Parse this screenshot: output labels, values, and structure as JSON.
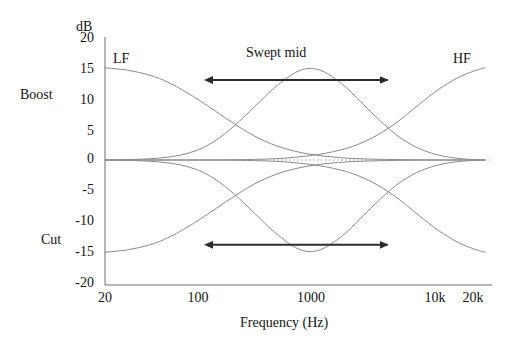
{
  "chart_data": {
    "type": "line",
    "title": "",
    "xlabel": "Frequency (Hz)",
    "ylabel": "dB",
    "xscale": "log",
    "xlim": [
      20,
      20000
    ],
    "ylim": [
      -20,
      20
    ],
    "grid": false,
    "legend": "none",
    "xticks": [
      {
        "value": 20,
        "label": "20"
      },
      {
        "value": 100,
        "label": "100"
      },
      {
        "value": 1000,
        "label": "1000"
      },
      {
        "value": 10000,
        "label": "10k"
      },
      {
        "value": 20000,
        "label": "20k"
      }
    ],
    "yticks": [
      {
        "value": 20,
        "label": "20"
      },
      {
        "value": 15,
        "label": "15"
      },
      {
        "value": 10,
        "label": "10"
      },
      {
        "value": 5,
        "label": "5"
      },
      {
        "value": 0,
        "label": "0"
      },
      {
        "value": -5,
        "label": "-5"
      },
      {
        "value": -10,
        "label": "-10"
      },
      {
        "value": -15,
        "label": "-15"
      },
      {
        "value": -20,
        "label": "-20"
      }
    ],
    "zero_line": {
      "value": 0,
      "style": "dotted"
    },
    "series": [
      {
        "name": "LF shelf boost",
        "band": "LF",
        "mode": "boost",
        "max_gain_db": 15,
        "points": [
          {
            "f": 20,
            "db": 15.0
          },
          {
            "f": 30,
            "db": 14.6
          },
          {
            "f": 45,
            "db": 13.8
          },
          {
            "f": 65,
            "db": 12.5
          },
          {
            "f": 100,
            "db": 10.3
          },
          {
            "f": 150,
            "db": 7.9
          },
          {
            "f": 220,
            "db": 5.6
          },
          {
            "f": 330,
            "db": 3.5
          },
          {
            "f": 500,
            "db": 2.0
          },
          {
            "f": 800,
            "db": 1.0
          },
          {
            "f": 1400,
            "db": 0.4
          },
          {
            "f": 2500,
            "db": 0.15
          },
          {
            "f": 5000,
            "db": 0.05
          },
          {
            "f": 10000,
            "db": 0.0
          },
          {
            "f": 20000,
            "db": 0.0
          }
        ]
      },
      {
        "name": "LF shelf cut",
        "band": "LF",
        "mode": "cut",
        "max_gain_db": -15,
        "points": [
          {
            "f": 20,
            "db": -15.0
          },
          {
            "f": 30,
            "db": -14.6
          },
          {
            "f": 45,
            "db": -13.8
          },
          {
            "f": 65,
            "db": -12.5
          },
          {
            "f": 100,
            "db": -10.3
          },
          {
            "f": 150,
            "db": -7.9
          },
          {
            "f": 220,
            "db": -5.6
          },
          {
            "f": 330,
            "db": -3.5
          },
          {
            "f": 500,
            "db": -2.0
          },
          {
            "f": 800,
            "db": -1.0
          },
          {
            "f": 1400,
            "db": -0.4
          },
          {
            "f": 2500,
            "db": -0.15
          },
          {
            "f": 5000,
            "db": -0.05
          },
          {
            "f": 10000,
            "db": 0.0
          },
          {
            "f": 20000,
            "db": 0.0
          }
        ]
      },
      {
        "name": "Swept mid boost",
        "band": "MID",
        "mode": "boost",
        "max_gain_db": 15,
        "center_hz": 700,
        "points": [
          {
            "f": 20,
            "db": 0.0
          },
          {
            "f": 40,
            "db": 0.15
          },
          {
            "f": 70,
            "db": 0.6
          },
          {
            "f": 110,
            "db": 1.7
          },
          {
            "f": 160,
            "db": 3.6
          },
          {
            "f": 230,
            "db": 6.3
          },
          {
            "f": 330,
            "db": 9.4
          },
          {
            "f": 470,
            "db": 12.3
          },
          {
            "f": 700,
            "db": 14.6
          },
          {
            "f": 1000,
            "db": 14.6
          },
          {
            "f": 1500,
            "db": 12.3
          },
          {
            "f": 2100,
            "db": 9.4
          },
          {
            "f": 3000,
            "db": 6.3
          },
          {
            "f": 4300,
            "db": 3.6
          },
          {
            "f": 6300,
            "db": 1.7
          },
          {
            "f": 9500,
            "db": 0.6
          },
          {
            "f": 14000,
            "db": 0.15
          },
          {
            "f": 20000,
            "db": 0.0
          }
        ]
      },
      {
        "name": "Swept mid cut",
        "band": "MID",
        "mode": "cut",
        "max_gain_db": -15,
        "center_hz": 700,
        "points": [
          {
            "f": 20,
            "db": 0.0
          },
          {
            "f": 40,
            "db": -0.15
          },
          {
            "f": 70,
            "db": -0.6
          },
          {
            "f": 110,
            "db": -1.7
          },
          {
            "f": 160,
            "db": -3.6
          },
          {
            "f": 230,
            "db": -6.3
          },
          {
            "f": 330,
            "db": -9.4
          },
          {
            "f": 470,
            "db": -12.3
          },
          {
            "f": 700,
            "db": -14.6
          },
          {
            "f": 1000,
            "db": -14.6
          },
          {
            "f": 1500,
            "db": -12.3
          },
          {
            "f": 2100,
            "db": -9.4
          },
          {
            "f": 3000,
            "db": -6.3
          },
          {
            "f": 4300,
            "db": -3.6
          },
          {
            "f": 6300,
            "db": -1.7
          },
          {
            "f": 9500,
            "db": -0.6
          },
          {
            "f": 14000,
            "db": -0.15
          },
          {
            "f": 20000,
            "db": 0.0
          }
        ]
      },
      {
        "name": "HF shelf boost",
        "band": "HF",
        "mode": "boost",
        "max_gain_db": 15,
        "points": [
          {
            "f": 20,
            "db": 0.0
          },
          {
            "f": 100,
            "db": 0.0
          },
          {
            "f": 300,
            "db": 0.1
          },
          {
            "f": 600,
            "db": 0.4
          },
          {
            "f": 1100,
            "db": 1.1
          },
          {
            "f": 1800,
            "db": 2.2
          },
          {
            "f": 2800,
            "db": 4.0
          },
          {
            "f": 4200,
            "db": 6.4
          },
          {
            "f": 6000,
            "db": 9.0
          },
          {
            "f": 8500,
            "db": 11.4
          },
          {
            "f": 12000,
            "db": 13.3
          },
          {
            "f": 16000,
            "db": 14.4
          },
          {
            "f": 20000,
            "db": 15.0
          }
        ]
      },
      {
        "name": "HF shelf cut",
        "band": "HF",
        "mode": "cut",
        "max_gain_db": -15,
        "points": [
          {
            "f": 20,
            "db": 0.0
          },
          {
            "f": 100,
            "db": 0.0
          },
          {
            "f": 300,
            "db": -0.1
          },
          {
            "f": 600,
            "db": -0.4
          },
          {
            "f": 1100,
            "db": -1.1
          },
          {
            "f": 1800,
            "db": -2.2
          },
          {
            "f": 2800,
            "db": -4.0
          },
          {
            "f": 4200,
            "db": -6.4
          },
          {
            "f": 6000,
            "db": -9.0
          },
          {
            "f": 8500,
            "db": -11.4
          },
          {
            "f": 12000,
            "db": -13.3
          },
          {
            "f": 16000,
            "db": -14.4
          },
          {
            "f": 20000,
            "db": -15.0
          }
        ]
      }
    ],
    "annotations": [
      {
        "name": "lf-label",
        "text": "LF",
        "f": 32,
        "db": 18.2
      },
      {
        "name": "hf-label",
        "text": "HF",
        "f": 11500,
        "db": 18.2
      },
      {
        "name": "swept-mid-label",
        "text": "Swept mid",
        "f": 800,
        "db": 18.6
      },
      {
        "name": "boost-label",
        "text": "Boost",
        "db": 10.5
      },
      {
        "name": "cut-label",
        "text": "Cut",
        "db": -13.5
      }
    ],
    "arrows": [
      {
        "name": "swept-mid-arrow-boost",
        "from_f": 140,
        "to_f": 3400,
        "db": 13.0,
        "heads": "both"
      },
      {
        "name": "swept-mid-arrow-cut",
        "from_f": 140,
        "to_f": 3400,
        "db": -13.8,
        "heads": "both"
      }
    ]
  },
  "labels": {
    "y_axis_unit": "dB",
    "x_axis_title": "Frequency (Hz)",
    "boost": "Boost",
    "cut": "Cut",
    "lf": "LF",
    "hf": "HF",
    "swept_mid": "Swept mid",
    "y_20": "20",
    "y_15": "15",
    "y_10": "10",
    "y_5": "5",
    "y_0": "0",
    "y_m5": "-5",
    "y_m10": "-10",
    "y_m15": "-15",
    "y_m20": "-20",
    "x_20": "20",
    "x_100": "100",
    "x_1000": "1000",
    "x_10k": "10k",
    "x_20k": "20k"
  },
  "colors": {
    "curve": "#8a8a8a",
    "axis": "#6e6e6e",
    "arrow": "#2b2b2b",
    "zero_line": "#9a9a9a",
    "text": "#141414",
    "background": "#ffffff"
  }
}
